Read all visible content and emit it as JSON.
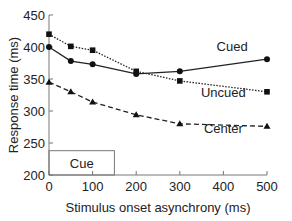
{
  "chart_data": {
    "type": "line",
    "title": "",
    "xlabel": "Stimulus onset asynchrony (ms)",
    "ylabel": "Response time (ms)",
    "x": [
      0,
      50,
      100,
      200,
      300,
      500
    ],
    "xticks": [
      0,
      100,
      200,
      300,
      400,
      500
    ],
    "yticks": [
      200,
      250,
      300,
      350,
      400,
      450
    ],
    "xlim": [
      0,
      500
    ],
    "ylim": [
      200,
      450
    ],
    "grid": false,
    "series": [
      {
        "name": "Cued",
        "style": "solid",
        "marker": "circle",
        "values": [
          400,
          378,
          373,
          358,
          362,
          381
        ]
      },
      {
        "name": "Uncued",
        "style": "dotted",
        "marker": "square",
        "values": [
          420,
          401,
          395,
          362,
          347,
          330
        ]
      },
      {
        "name": "Center",
        "style": "dashed",
        "marker": "triangle",
        "values": [
          345,
          330,
          314,
          294,
          280,
          276
        ]
      }
    ],
    "annotations": [
      {
        "text": "Cue",
        "type": "box",
        "x_range": [
          0,
          150
        ],
        "y_range": [
          200,
          238
        ]
      },
      {
        "text": "Cued",
        "x": 420,
        "y": 393
      },
      {
        "text": "Uncued",
        "x": 400,
        "y": 322
      },
      {
        "text": "Center",
        "x": 400,
        "y": 265
      }
    ]
  }
}
